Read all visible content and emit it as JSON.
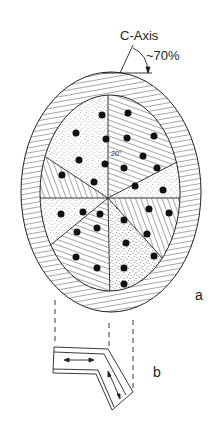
{
  "figure": {
    "axis_label": "C-Axis",
    "angle_label": "~70%",
    "inner_angle_label": "20°",
    "panel_a_label": "a",
    "panel_b_label": "b"
  },
  "geometry": {
    "outer_ellipse": {
      "cx": 111,
      "cy": 192,
      "rx": 90,
      "ry": 120
    },
    "inner_ellipse": {
      "cx": 110,
      "cy": 193,
      "rx": 70,
      "ry": 98
    },
    "sector_center": {
      "x": 108,
      "y": 198
    },
    "sectors": 8,
    "sector_patterns": [
      "hatched",
      "stippled",
      "hatched",
      "stippled",
      "hatched",
      "stippled",
      "hatched",
      "stippled"
    ]
  },
  "colors": {
    "ink": "#222222",
    "background": "#ffffff",
    "stipple": "#555555"
  }
}
